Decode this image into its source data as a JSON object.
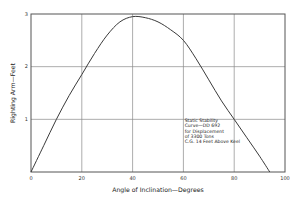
{
  "chart_data": {
    "type": "line",
    "title": "",
    "xlabel": "Angle of Inclination—Degrees",
    "ylabel": "Righting Arm—Feet",
    "xlim": [
      0,
      100
    ],
    "ylim": [
      0,
      3
    ],
    "x_ticks": [
      0,
      20,
      40,
      60,
      80,
      100
    ],
    "y_ticks": [
      1,
      2,
      3
    ],
    "x_tick_labels": [
      "0",
      "20",
      "40",
      "60",
      "80",
      "100"
    ],
    "y_tick_labels": [
      "1",
      "2",
      "3"
    ],
    "grid": true,
    "legend": "none",
    "series": [
      {
        "name": "Static Stability Curve",
        "x": [
          0,
          5,
          10,
          15,
          20,
          25,
          30,
          35,
          40,
          45,
          50,
          55,
          60,
          65,
          70,
          75,
          80,
          85,
          90,
          94
        ],
        "values": [
          0,
          0.5,
          1.0,
          1.45,
          1.85,
          2.25,
          2.6,
          2.85,
          2.95,
          2.93,
          2.85,
          2.7,
          2.5,
          2.15,
          1.75,
          1.35,
          1.0,
          0.65,
          0.3,
          0
        ]
      }
    ],
    "annotations": [
      {
        "lines": [
          "Static Stability",
          "Curve—DD 692",
          "for Displacement",
          "of 3300 Tons",
          "C.G. 14 Feet Above Keel"
        ],
        "position": "lower-right"
      }
    ]
  },
  "colors": {
    "line": "#3a3a3a",
    "grid": "#8a8a8a",
    "frame": "#555555",
    "background": "#ffffff"
  }
}
